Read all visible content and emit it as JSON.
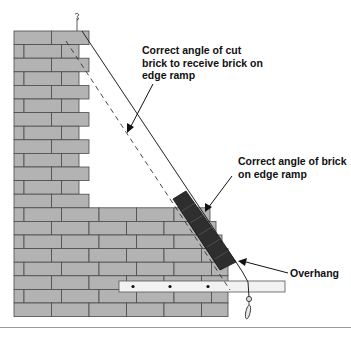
{
  "diagram": {
    "labels": {
      "cut_angle": "Correct angle of cut\nbrick to receive brick on\nedge ramp",
      "brick_angle": "Correct angle of brick\non edge ramp",
      "overhang": "Overhang"
    },
    "colors": {
      "brick_fill": "#b3b3b3",
      "mortar": "#4a4a4a",
      "ramp_brick": "#2e2e2e",
      "board": "#f2f2f2",
      "line": "#222222",
      "rule": "#9a9a9a"
    },
    "elements": [
      "brick-wall",
      "edge-ramp-bricks",
      "string-line",
      "dashed-cut-line",
      "timber-board",
      "plumb-bob"
    ]
  }
}
